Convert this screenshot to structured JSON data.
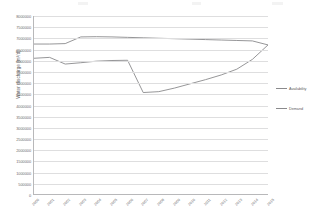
{
  "chart_data": {
    "type": "line",
    "title": "",
    "xlabel": "",
    "ylabel": "Water discharge [m³/d]",
    "ylim": [
      0,
      8000000
    ],
    "grid": true,
    "legend_position": "right",
    "categories": [
      "2000",
      "2001",
      "2002",
      "2003",
      "2004",
      "2005",
      "2006",
      "2007",
      "2008",
      "2009",
      "2010",
      "2011",
      "2012",
      "2013",
      "2014",
      "2015"
    ],
    "yticks": [
      "8000000",
      "7500000",
      "7000000",
      "6500000",
      "6000000",
      "5500000",
      "5000000",
      "4500000",
      "4000000",
      "3500000",
      "3000000",
      "2500000",
      "2000000",
      "1500000",
      "1000000",
      "500000",
      "0"
    ],
    "yticks_shown": [
      "8000000",
      "7500000",
      "7000000",
      "6500000",
      "6000000",
      "5500000",
      "5000000",
      "4500000",
      "4000000",
      "3500000",
      "3000000",
      "2500000",
      "2000000",
      "1500000",
      "1000000",
      "500000",
      "0"
    ],
    "series": [
      {
        "name": "Availability",
        "color": "#8a8a8c",
        "values": [
          6740000,
          6740000,
          6760000,
          7060000,
          7070000,
          7060000,
          7040000,
          7020000,
          7000000,
          6980000,
          6960000,
          6940000,
          6920000,
          6900000,
          6880000,
          6700000
        ]
      },
      {
        "name": "Demand",
        "color": "#8a8a8c",
        "values": [
          6100000,
          6140000,
          5840000,
          5900000,
          5970000,
          6000000,
          6010000,
          4560000,
          4600000,
          4760000,
          4950000,
          5140000,
          5350000,
          5610000,
          6050000,
          6700000
        ]
      }
    ]
  },
  "yaxis": {
    "title": "Water discharge [m³/d]"
  },
  "legend": {
    "items": [
      {
        "label": "Availability",
        "color": "#8a8a8c"
      },
      {
        "label": "Demand",
        "color": "#8a8a8c"
      }
    ]
  }
}
